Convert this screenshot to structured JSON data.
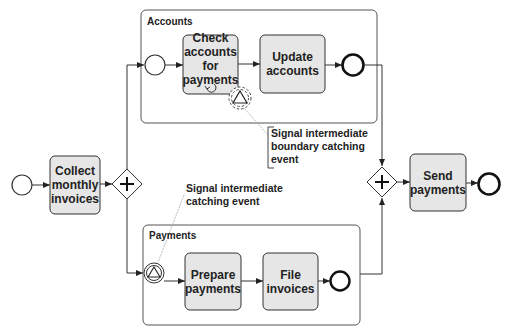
{
  "diagram": {
    "type": "BPMN process",
    "colors": {
      "task_fill": "#e6e6e6",
      "stroke": "#333333",
      "pool_stroke": "#555555"
    },
    "pools": [
      {
        "id": "accounts",
        "label": "Accounts"
      },
      {
        "id": "payments",
        "label": "Payments"
      }
    ],
    "tasks": {
      "collect": "Collect monthly invoices",
      "check": "Check accounts for payments",
      "update": "Update accounts",
      "prepare": "Prepare payments",
      "file": "File invoices",
      "send": "Send payments"
    },
    "task_lines": {
      "collect": [
        "Collect",
        "monthly",
        "invoices"
      ],
      "check": [
        "Check",
        "accounts",
        "for",
        "payments"
      ],
      "update": [
        "Update",
        "accounts"
      ],
      "prepare": [
        "Prepare",
        "payments"
      ],
      "file": [
        "File",
        "invoices"
      ],
      "send": [
        "Send",
        "payments"
      ]
    },
    "annotations": {
      "boundary": {
        "line1": "Signal intermediate",
        "line2": "boundary catching",
        "line3": "event"
      },
      "catching": {
        "line1": "Signal intermediate",
        "line2": "catching event"
      }
    },
    "gateways": [
      {
        "id": "split",
        "type": "parallel",
        "symbol": "+"
      },
      {
        "id": "join",
        "type": "parallel",
        "symbol": "+"
      }
    ]
  }
}
